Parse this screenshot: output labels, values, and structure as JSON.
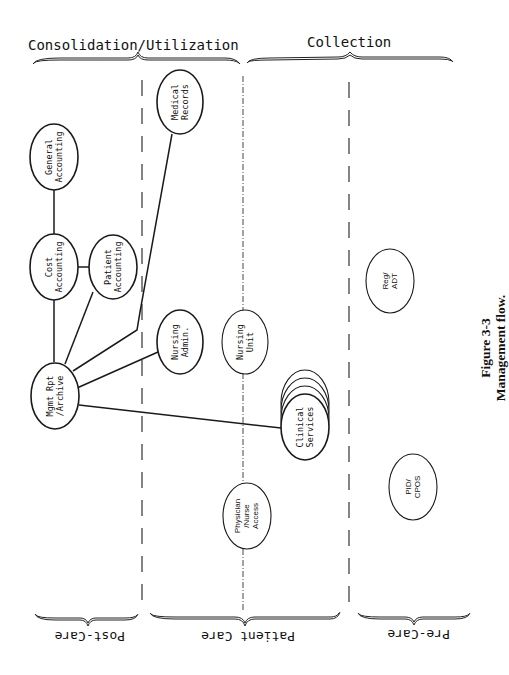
{
  "header": {
    "left_group": "Consolidation/Utilization",
    "right_group": "Collection"
  },
  "footer": {
    "post_care": "Post-Care",
    "patient_care": "Patient Care",
    "pre_care": "Pre-Care"
  },
  "nodes": {
    "general_accounting": {
      "line1": "General",
      "line2": "Accounting"
    },
    "cost_accounting": {
      "line1": "Cost",
      "line2": "Accounting"
    },
    "patient_accounting": {
      "line1": "Patient",
      "line2": "Accounting"
    },
    "mgmt_rpt_archive": {
      "line1": "Mgmt Rpt",
      "line2": "/Archive"
    },
    "medical_records": {
      "line1": "Medical",
      "line2": "Records"
    },
    "nursing_admin": {
      "line1": "Nursing",
      "line2": "Admin."
    },
    "nursing_unit": {
      "line1": "Nursing",
      "line2": "Unit"
    },
    "clinical_services": {
      "line1": "Clinical",
      "line2": "Services"
    },
    "physician_nurse_access": {
      "line1": "Physician",
      "line2": "/Nurse",
      "line3": "Access"
    },
    "reg_adt": {
      "line1": "Reg/",
      "line2": "ADT"
    },
    "pid_cpos": {
      "line1": "PID/",
      "line2": "CPOS"
    }
  },
  "caption": {
    "figure_number": "Figure 3-3",
    "title": "Management flow."
  },
  "colors": {
    "ink": "#1a1a1a",
    "background": "#ffffff"
  }
}
